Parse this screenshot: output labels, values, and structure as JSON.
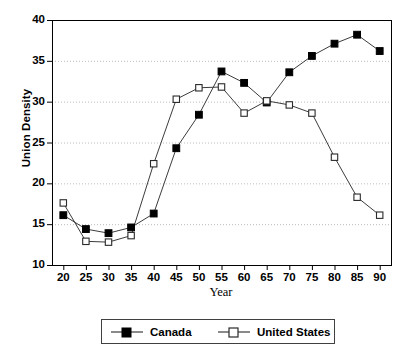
{
  "chart_data": {
    "type": "line",
    "title": "",
    "subtitle": "",
    "xlabel": "Year",
    "ylabel": "Union Density",
    "x": [
      20,
      25,
      30,
      35,
      40,
      45,
      50,
      55,
      60,
      65,
      70,
      75,
      80,
      85,
      90
    ],
    "xtick_labels": [
      "20",
      "25",
      "30",
      "35",
      "40",
      "45",
      "50",
      "55",
      "60",
      "65",
      "70",
      "75",
      "80",
      "85",
      "90"
    ],
    "ytick_labels": [
      "10",
      "15",
      "20",
      "25",
      "30",
      "35",
      "40"
    ],
    "yticks": [
      10,
      15,
      20,
      25,
      30,
      35,
      40
    ],
    "xlim": [
      17.5,
      92.5
    ],
    "ylim": [
      10,
      40
    ],
    "grid": "horizontal-dotted",
    "legend_position": "below-center",
    "series": [
      {
        "name": "Canada",
        "marker": "filled-square",
        "color": "#000000",
        "values": [
          16.1,
          14.4,
          13.9,
          14.6,
          16.3,
          24.3,
          28.4,
          33.7,
          32.3,
          29.9,
          33.6,
          35.6,
          37.1,
          38.2,
          36.2
        ]
      },
      {
        "name": "United States",
        "marker": "open-square",
        "color": "#000000",
        "values": [
          17.6,
          12.9,
          12.8,
          13.6,
          22.4,
          30.3,
          31.7,
          31.8,
          28.6,
          30.1,
          29.6,
          28.6,
          23.2,
          18.3,
          16.1
        ]
      }
    ]
  },
  "legend": {
    "items": [
      {
        "label": "Canada",
        "marker": "filled-square"
      },
      {
        "label": "United States",
        "marker": "open-square"
      }
    ]
  },
  "colors": {
    "axis": "#000000",
    "grid": "#b4b4b4",
    "plot_background": "#ffffff",
    "line": "#3c3c3c",
    "marker_fill_canada": "#000000",
    "marker_fill_us": "#ffffff"
  }
}
